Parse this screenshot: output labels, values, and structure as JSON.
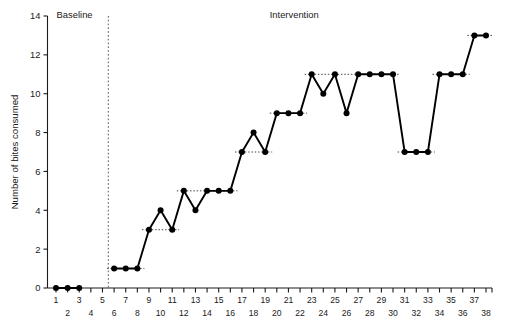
{
  "chart_data": {
    "type": "line",
    "title": "",
    "xlabel": "",
    "ylabel": "Number of bites consumed",
    "xlim": [
      0,
      39
    ],
    "ylim": [
      0,
      14
    ],
    "ytick_values": [
      0,
      2,
      4,
      6,
      8,
      10,
      12,
      14
    ],
    "ytick_labels": [
      "0",
      "2",
      "4",
      "6",
      "8",
      "10",
      "12",
      "14"
    ],
    "xtick_values": [
      1,
      2,
      3,
      4,
      5,
      6,
      7,
      8,
      9,
      10,
      11,
      12,
      13,
      14,
      15,
      16,
      17,
      18,
      19,
      20,
      21,
      22,
      23,
      24,
      25,
      26,
      27,
      28,
      29,
      30,
      31,
      32,
      33,
      34,
      35,
      36,
      37,
      38
    ],
    "xtick_labels": [
      "1",
      "2",
      "3",
      "4",
      "5",
      "6",
      "7",
      "8",
      "9",
      "10",
      "11",
      "12",
      "13",
      "14",
      "15",
      "16",
      "17",
      "18",
      "19",
      "20",
      "21",
      "22",
      "23",
      "24",
      "25",
      "26",
      "27",
      "28",
      "29",
      "30",
      "31",
      "32",
      "33",
      "34",
      "35",
      "36",
      "37",
      "38"
    ],
    "grid": false,
    "legend": false,
    "series": [
      {
        "name": "Bites consumed",
        "x": [
          1,
          2,
          3,
          6,
          7,
          8,
          9,
          10,
          11,
          12,
          13,
          14,
          15,
          16,
          17,
          18,
          19,
          20,
          21,
          22,
          23,
          24,
          25,
          26,
          27,
          28,
          29,
          30,
          31,
          32,
          33,
          34,
          35,
          36,
          37,
          38
        ],
        "values": [
          0,
          0,
          0,
          1,
          1,
          1,
          3,
          4,
          3,
          5,
          4,
          5,
          5,
          5,
          7,
          8,
          7,
          9,
          9,
          9,
          11,
          10,
          11,
          9,
          11,
          11,
          11,
          11,
          7,
          7,
          7,
          11,
          11,
          11,
          13,
          13
        ]
      }
    ],
    "phase_change_x": 5.5,
    "phase_labels": [
      {
        "text": "Baseline",
        "x": 2.6,
        "y": 14.0
      },
      {
        "text": "Intervention",
        "x": 21.5,
        "y": 14.0
      }
    ],
    "mean_levels": [
      {
        "x_start": 6,
        "x_end": 8,
        "value": 1
      },
      {
        "x_start": 9,
        "x_end": 11,
        "value": 3
      },
      {
        "x_start": 12,
        "x_end": 16,
        "value": 5
      },
      {
        "x_start": 17,
        "x_end": 19,
        "value": 7
      },
      {
        "x_start": 20,
        "x_end": 22,
        "value": 9
      },
      {
        "x_start": 23,
        "x_end": 30,
        "value": 11
      },
      {
        "x_start": 31,
        "x_end": 33,
        "value": 7
      },
      {
        "x_start": 34,
        "x_end": 36,
        "value": 11
      },
      {
        "x_start": 37,
        "x_end": 38,
        "value": 13
      }
    ],
    "colors": {
      "line": "#000000",
      "point": "#000000",
      "axis": "#1a1a1a",
      "phase_divider": "#555555",
      "mean_line": "#333333",
      "background": "#ffffff"
    }
  }
}
